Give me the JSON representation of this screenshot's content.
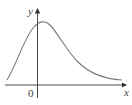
{
  "diagram": {
    "axes": {
      "x_label": "x",
      "y_label": "y",
      "origin_label": "0"
    },
    "curve": {
      "description": "skewed bell-shaped curve with peak slightly right of the y-axis, approaching a horizontal asymptote above the x-axis on both sides",
      "color": "#7a7a7a"
    },
    "axis_color": "#333333"
  }
}
